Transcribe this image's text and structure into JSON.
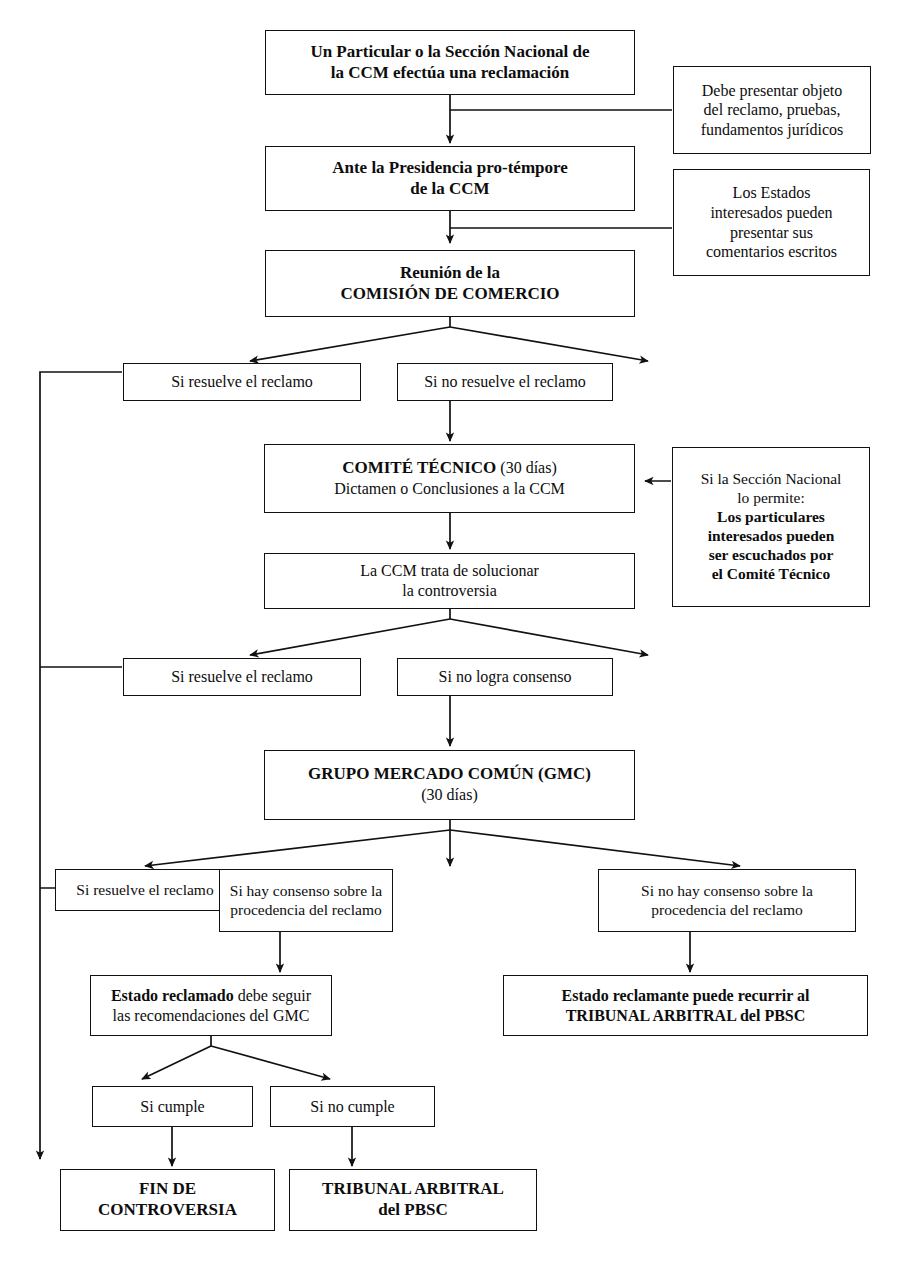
{
  "diagram": {
    "type": "flowchart",
    "nodes": {
      "reclamacion": {
        "line1": "Un Particular o la Sección Nacional de",
        "line2": "la CCM efectúa una reclamación"
      },
      "presidencia": {
        "line1": "Ante la Presidencia pro-témpore",
        "line2": "de la CCM"
      },
      "comision": {
        "line1": "Reunión de la",
        "line2": "COMISIÓN DE COMERCIO"
      },
      "nota_pruebas": {
        "line1": "Debe presentar objeto",
        "line2": "del reclamo, pruebas,",
        "line3": "fundamentos jurídicos"
      },
      "nota_estados": {
        "line1": "Los Estados",
        "line2": "interesados pueden",
        "line3": "presentar  sus",
        "line4": "comentarios escritos"
      },
      "ccm_resuelve": {
        "label": "Si resuelve el reclamo"
      },
      "ccm_no_resuelve": {
        "label": "Si no resuelve el reclamo"
      },
      "comite_tecnico": {
        "line1_bold": "COMITÉ TÉCNICO",
        "line1_plain": " (30 días)",
        "line2": "Dictamen o Conclusiones a la CCM"
      },
      "nota_particulares": {
        "line1": "Si la Sección Nacional",
        "line2": "lo permite:",
        "line3": "Los particulares",
        "line4": "interesados pueden",
        "line5": "ser escuchados por",
        "line6": "el Comité Técnico"
      },
      "ccm_soluciona": {
        "line1": "La CCM trata de solucionar",
        "line2": "la controversia"
      },
      "ct_resuelve": {
        "label": "Si resuelve el reclamo"
      },
      "ct_no_consenso": {
        "label": "Si no logra consenso"
      },
      "gmc": {
        "line1": "GRUPO MERCADO COMÚN (GMC)",
        "line2": "(30 días)"
      },
      "gmc_resuelve": {
        "label": "Si resuelve el reclamo"
      },
      "gmc_consenso": {
        "line1": "Si hay consenso sobre la",
        "line2": "procedencia del reclamo"
      },
      "gmc_no_consenso": {
        "line1": "Si no hay consenso sobre la",
        "line2": "procedencia del reclamo"
      },
      "estado_reclamado": {
        "line1_bold": "Estado reclamado",
        "line1_plain": " debe seguir",
        "line2": "las recomendaciones del GMC"
      },
      "estado_reclamante": {
        "line1": "Estado reclamante puede recurrir al",
        "line2": "TRIBUNAL ARBITRAL del PBSC"
      },
      "si_cumple": {
        "label": "Si cumple"
      },
      "si_no_cumple": {
        "label": "Si no cumple"
      },
      "fin": {
        "line1": "FIN DE",
        "line2": "CONTROVERSIA"
      },
      "tribunal": {
        "line1": "TRIBUNAL ARBITRAL",
        "line2": "del PBSC"
      }
    },
    "colors": {
      "stroke": "#111111",
      "background": "#ffffff",
      "text": "#0d0d0d"
    }
  }
}
